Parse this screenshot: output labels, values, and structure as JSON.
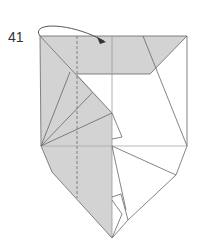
{
  "diagram": {
    "type": "origami-step",
    "step_number": "41",
    "colors": {
      "paper_colored": "#d3d3d3",
      "paper_white": "#ffffff",
      "line": "#666666",
      "light_line": "#aaaaaa"
    },
    "annotations": {
      "arrow": "fold-over arrow from left corner to top band",
      "valley_fold": "dashed vertical line"
    }
  }
}
